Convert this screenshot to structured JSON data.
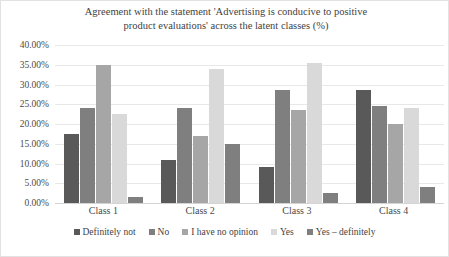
{
  "chart_data": {
    "type": "bar",
    "title": "Agreement with the statement 'Advertising is conducive to positive\nproduct evaluations' across the latent classes (%)",
    "xlabel": "",
    "ylabel": "",
    "ylim": [
      0,
      40
    ],
    "ytick_step": 5,
    "ytick_labels": [
      "40.00%",
      "35.00%",
      "30.00%",
      "25.00%",
      "20.00%",
      "15.00%",
      "10.00%",
      "5.00%",
      "0.00%"
    ],
    "ytick_values": [
      40,
      35,
      30,
      25,
      20,
      15,
      10,
      5,
      0
    ],
    "grid": true,
    "legend_position": "bottom",
    "categories": [
      "Class 1",
      "Class 2",
      "Class 3",
      "Class 4"
    ],
    "series": [
      {
        "name": "Definitely not",
        "color": "#595959",
        "values": [
          17.5,
          11.0,
          9.0,
          28.5
        ]
      },
      {
        "name": "No",
        "color": "#7f7f7f",
        "values": [
          24.0,
          24.0,
          28.5,
          24.5
        ]
      },
      {
        "name": "I have no opinion",
        "color": "#a6a6a6",
        "values": [
          35.0,
          17.0,
          23.5,
          20.0
        ]
      },
      {
        "name": "Yes",
        "color": "#d9d9d9",
        "values": [
          22.5,
          34.0,
          35.5,
          24.0
        ]
      },
      {
        "name": "Yes – definitely",
        "color": "#7f7f7f",
        "values": [
          1.5,
          15.0,
          2.5,
          4.0
        ]
      }
    ]
  }
}
